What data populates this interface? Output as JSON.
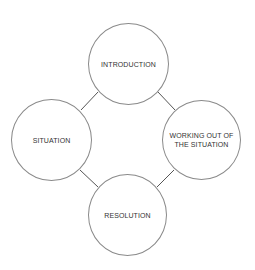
{
  "diagram": {
    "type": "cycle",
    "nodes": [
      {
        "id": "introduction",
        "label": "INTRODUCTION"
      },
      {
        "id": "working-out",
        "label": "WORKING OUT OF THE SITUATION"
      },
      {
        "id": "resolution",
        "label": "RESOLUTION"
      },
      {
        "id": "situation",
        "label": "SITUATION"
      }
    ],
    "edges": [
      [
        "introduction",
        "working-out"
      ],
      [
        "working-out",
        "resolution"
      ],
      [
        "resolution",
        "situation"
      ],
      [
        "situation",
        "introduction"
      ]
    ],
    "colors": {
      "stroke": "#8a8a8a",
      "connector": "#555555",
      "text": "#333333"
    }
  }
}
